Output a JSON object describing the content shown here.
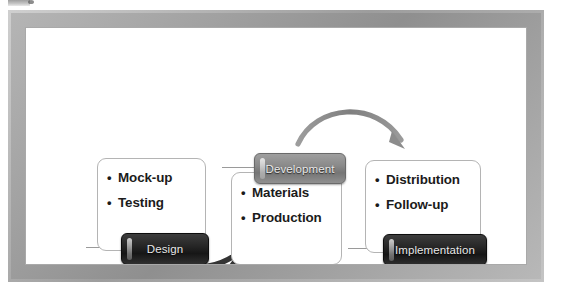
{
  "diagram": {
    "colors": {
      "frame": "#9d9d9d",
      "canvas": "#ffffff",
      "card_border": "#b4b4b4",
      "badge_dark": "#1a1a1a",
      "badge_gray": "#858585",
      "arrow_dark": "#3a3a3a",
      "arrow_gray": "#8c8c8c",
      "text": "#1b1b1b",
      "badge_text": "#e8e8e8"
    },
    "stages": [
      {
        "badge": "Design",
        "badge_style": "dark",
        "items": [
          "Mock-up",
          "Testing"
        ]
      },
      {
        "badge": "Development",
        "badge_style": "gray",
        "items": [
          "Materials",
          "Production"
        ]
      },
      {
        "badge": "Implementation",
        "badge_style": "dark",
        "items": [
          "Distribution",
          "Follow-up"
        ]
      }
    ],
    "arrows": [
      {
        "name": "design-to-development",
        "from": "Design",
        "to": "Development",
        "style": "dark-curve-below"
      },
      {
        "name": "development-to-implementation",
        "from": "Development",
        "to": "Implementation",
        "style": "gray-arc-above"
      }
    ],
    "bullet_glyph": "•"
  }
}
